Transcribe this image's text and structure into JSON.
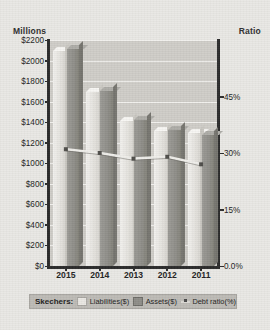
{
  "labels": {
    "left_axis_title": "Millions",
    "right_axis_title": "Ratio"
  },
  "legend": {
    "series_name": "Skechers:",
    "items": [
      {
        "label": "Liabilities($)",
        "icon": "swatch-light",
        "color": "#e4e2dd"
      },
      {
        "label": "Assets($)",
        "icon": "swatch-dark",
        "color": "#8e8d88"
      },
      {
        "label": "Debt ratio(%)",
        "icon": "line-marker",
        "color": "#d9d7d2"
      }
    ]
  },
  "chart_data": {
    "type": "bar",
    "title": "",
    "subtitle": "",
    "xlabel": "",
    "ylabel": "Millions",
    "y2label": "Ratio",
    "categories": [
      "2015",
      "2014",
      "2013",
      "2012",
      "2011"
    ],
    "series": [
      {
        "name": "Liabilities($)",
        "axis": "left",
        "type": "bar",
        "values": [
          2090,
          1690,
          1410,
          1310,
          1290
        ]
      },
      {
        "name": "Assets($)",
        "axis": "left",
        "type": "bar",
        "values": [
          2110,
          1700,
          1420,
          1320,
          1280
        ]
      },
      {
        "name": "Debt ratio(%)",
        "axis": "right",
        "type": "line",
        "values": [
          31,
          30,
          28.5,
          29,
          27
        ]
      }
    ],
    "ylim": [
      0,
      2200
    ],
    "yticks": [
      "$0",
      "$200",
      "$400",
      "$600",
      "$800",
      "$1000",
      "$1200",
      "$1400",
      "$1600",
      "$1800",
      "$2000",
      "$2200"
    ],
    "y2lim": [
      0,
      60
    ],
    "y2ticks": [
      "0.0%",
      "15%",
      "30%",
      "45%"
    ],
    "grid": true,
    "legend_position": "bottom"
  }
}
